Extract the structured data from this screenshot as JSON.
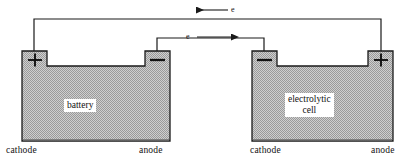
{
  "figure": {
    "background_color": "#ffffff",
    "line_color": "#1a1a1a",
    "fill_color": "#b5b5b5",
    "label_color": "#111111"
  },
  "devices": [
    {
      "id": "battery",
      "label": "battery",
      "left_terminal": {
        "sign": "+",
        "symbol": "plus-symbol",
        "electrode_label": "cathode"
      },
      "right_terminal": {
        "sign": "−",
        "symbol": "minus-symbol",
        "electrode_label": "anode"
      }
    },
    {
      "id": "electrolytic-cell",
      "label": "electrolytic\ncell",
      "label_line1": "electrolytic",
      "label_line2": "cell",
      "left_terminal": {
        "sign": "−",
        "symbol": "minus-symbol",
        "electrode_label": "cathode"
      },
      "right_terminal": {
        "sign": "+",
        "symbol": "plus-symbol",
        "electrode_label": "anode"
      }
    }
  ],
  "wires": [
    {
      "id": "top-wire",
      "from": "battery-cathode-plus",
      "to": "cell-anode-plus",
      "flow_label": "e",
      "arrow_direction": "left"
    },
    {
      "id": "middle-wire",
      "from": "battery-anode-minus",
      "to": "cell-cathode-minus",
      "flow_label": "e",
      "arrow_direction": "right"
    }
  ],
  "labels": {
    "battery_name": "battery",
    "cell_name_line1": "electrolytic",
    "cell_name_line2": "cell",
    "battery_cathode": "cathode",
    "battery_anode": "anode",
    "cell_cathode": "cathode",
    "cell_anode": "anode",
    "electron_top": "e",
    "electron_middle": "e"
  }
}
